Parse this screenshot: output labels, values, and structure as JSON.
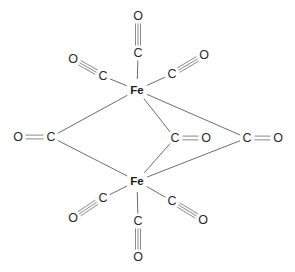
{
  "figure": {
    "compound_formula": "Fe2(CO)9",
    "background_color": "#ffffff",
    "bond_color": "#5b5b5b",
    "label_color": "#2a2a2a",
    "metal_label_color": "#1c1c1c"
  },
  "chart_data": {
    "type": "diagram",
    "atoms": [
      {
        "id": "fe-top",
        "element": "Fe",
        "label": "Fe",
        "x": 137,
        "y": 90,
        "role": "metal-center"
      },
      {
        "id": "fe-bottom",
        "element": "Fe",
        "label": "Fe",
        "x": 137,
        "y": 181,
        "role": "metal-center"
      },
      {
        "id": "c-top",
        "element": "C",
        "label": "C",
        "x": 138,
        "y": 53,
        "role": "terminal-carbonyl-carbon"
      },
      {
        "id": "o-top",
        "element": "O",
        "label": "O",
        "x": 138,
        "y": 16,
        "role": "terminal-carbonyl-oxygen"
      },
      {
        "id": "c-upper-left",
        "element": "C",
        "label": "C",
        "x": 103,
        "y": 76,
        "role": "terminal-carbonyl-carbon"
      },
      {
        "id": "o-upper-left",
        "element": "O",
        "label": "O",
        "x": 73,
        "y": 59,
        "role": "terminal-carbonyl-oxygen"
      },
      {
        "id": "c-upper-right",
        "element": "C",
        "label": "C",
        "x": 172,
        "y": 74,
        "role": "terminal-carbonyl-carbon"
      },
      {
        "id": "o-upper-right",
        "element": "O",
        "label": "O",
        "x": 204,
        "y": 55,
        "role": "terminal-carbonyl-oxygen"
      },
      {
        "id": "c-bridge-left",
        "element": "C",
        "label": "C",
        "x": 51,
        "y": 137,
        "role": "bridging-carbonyl-carbon"
      },
      {
        "id": "o-bridge-left",
        "element": "O",
        "label": "O",
        "x": 18,
        "y": 137,
        "role": "bridging-carbonyl-oxygen"
      },
      {
        "id": "c-bridge-mid",
        "element": "C",
        "label": "C",
        "x": 175,
        "y": 138,
        "role": "bridging-carbonyl-carbon"
      },
      {
        "id": "o-bridge-mid",
        "element": "O",
        "label": "O",
        "x": 206,
        "y": 138,
        "role": "bridging-carbonyl-oxygen"
      },
      {
        "id": "c-bridge-right",
        "element": "C",
        "label": "C",
        "x": 247,
        "y": 138,
        "role": "bridging-carbonyl-carbon"
      },
      {
        "id": "o-bridge-right",
        "element": "O",
        "label": "O",
        "x": 278,
        "y": 138,
        "role": "bridging-carbonyl-oxygen"
      },
      {
        "id": "c-lower-left",
        "element": "C",
        "label": "C",
        "x": 103,
        "y": 198,
        "role": "terminal-carbonyl-carbon"
      },
      {
        "id": "o-lower-left",
        "element": "O",
        "label": "O",
        "x": 73,
        "y": 218,
        "role": "terminal-carbonyl-oxygen"
      },
      {
        "id": "c-lower-right",
        "element": "C",
        "label": "C",
        "x": 172,
        "y": 201,
        "role": "terminal-carbonyl-carbon"
      },
      {
        "id": "o-lower-right",
        "element": "O",
        "label": "O",
        "x": 203,
        "y": 220,
        "role": "terminal-carbonyl-oxygen"
      },
      {
        "id": "c-bottom",
        "element": "C",
        "label": "C",
        "x": 138,
        "y": 221,
        "role": "terminal-carbonyl-carbon"
      },
      {
        "id": "o-bottom",
        "element": "O",
        "label": "O",
        "x": 138,
        "y": 257,
        "role": "terminal-carbonyl-oxygen"
      }
    ],
    "bonds": [
      {
        "id": "b-fetop-ctop",
        "from": "fe-top",
        "to": "c-top",
        "order": 1,
        "kind": "metal-carbon"
      },
      {
        "id": "b-ctop-otop",
        "from": "c-top",
        "to": "o-top",
        "order": 3,
        "kind": "carbonyl"
      },
      {
        "id": "b-fetop-cul",
        "from": "fe-top",
        "to": "c-upper-left",
        "order": 1,
        "kind": "metal-carbon"
      },
      {
        "id": "b-cul-oul",
        "from": "c-upper-left",
        "to": "o-upper-left",
        "order": 3,
        "kind": "carbonyl"
      },
      {
        "id": "b-fetop-cur",
        "from": "fe-top",
        "to": "c-upper-right",
        "order": 1,
        "kind": "metal-carbon"
      },
      {
        "id": "b-cur-our",
        "from": "c-upper-right",
        "to": "o-upper-right",
        "order": 3,
        "kind": "carbonyl"
      },
      {
        "id": "b-fetop-cbl",
        "from": "fe-top",
        "to": "c-bridge-left",
        "order": 1,
        "kind": "bridge"
      },
      {
        "id": "b-febot-cbl",
        "from": "fe-bottom",
        "to": "c-bridge-left",
        "order": 1,
        "kind": "bridge"
      },
      {
        "id": "b-cbl-obl",
        "from": "c-bridge-left",
        "to": "o-bridge-left",
        "order": 2,
        "kind": "carbonyl"
      },
      {
        "id": "b-fetop-cbm",
        "from": "fe-top",
        "to": "c-bridge-mid",
        "order": 1,
        "kind": "bridge"
      },
      {
        "id": "b-febot-cbm",
        "from": "fe-bottom",
        "to": "c-bridge-mid",
        "order": 1,
        "kind": "bridge"
      },
      {
        "id": "b-cbm-obm",
        "from": "c-bridge-mid",
        "to": "o-bridge-mid",
        "order": 2,
        "kind": "carbonyl"
      },
      {
        "id": "b-fetop-cbr",
        "from": "fe-top",
        "to": "c-bridge-right",
        "order": 1,
        "kind": "bridge"
      },
      {
        "id": "b-febot-cbr",
        "from": "fe-bottom",
        "to": "c-bridge-right",
        "order": 1,
        "kind": "bridge"
      },
      {
        "id": "b-cbr-obr",
        "from": "c-bridge-right",
        "to": "o-bridge-right",
        "order": 2,
        "kind": "carbonyl"
      },
      {
        "id": "b-febot-cll",
        "from": "fe-bottom",
        "to": "c-lower-left",
        "order": 1,
        "kind": "metal-carbon"
      },
      {
        "id": "b-cll-oll",
        "from": "c-lower-left",
        "to": "o-lower-left",
        "order": 3,
        "kind": "carbonyl"
      },
      {
        "id": "b-febot-clr",
        "from": "fe-bottom",
        "to": "c-lower-right",
        "order": 1,
        "kind": "metal-carbon"
      },
      {
        "id": "b-clr-olr",
        "from": "c-lower-right",
        "to": "o-lower-right",
        "order": 3,
        "kind": "carbonyl"
      },
      {
        "id": "b-febot-cbottom",
        "from": "fe-bottom",
        "to": "c-bottom",
        "order": 1,
        "kind": "metal-carbon"
      },
      {
        "id": "b-cbottom-obottom",
        "from": "c-bottom",
        "to": "o-bottom",
        "order": 3,
        "kind": "carbonyl"
      }
    ]
  }
}
